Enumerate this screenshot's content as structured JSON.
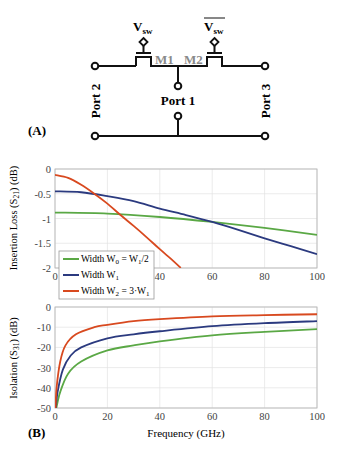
{
  "panel_a": {
    "label": "(A)",
    "ports": [
      "Port 1",
      "Port 2",
      "Port 3"
    ],
    "transistors": [
      "M1",
      "M2"
    ],
    "controls": {
      "v1": "V",
      "v1_sub": "sw",
      "v2": "V",
      "v2_sub": "sw",
      "v2_overbar": true
    }
  },
  "panel_b": {
    "label": "(B)",
    "xlabel": "Frequency (GHz)"
  },
  "colors": {
    "w0": "#5aa845",
    "w1": "#2b3a7f",
    "w2": "#d8491f",
    "grid": "#e3e3e3",
    "axis": "#b8b8b8"
  },
  "chart_data": [
    {
      "type": "line",
      "title": "",
      "xlabel": "",
      "ylabel": "Insertion Loss (S21) (dB)",
      "xlim": [
        0,
        100
      ],
      "ylim": [
        -2,
        0
      ],
      "xticks": [
        0,
        20,
        40,
        60,
        80,
        100
      ],
      "yticks": [
        0,
        -0.5,
        -1,
        -1.5,
        -2
      ],
      "ytick_labels": [
        "0",
        "-0.5",
        "-1",
        "-1.5",
        "-2"
      ],
      "grid": true,
      "legend_position": "lower left",
      "series": [
        {
          "name": "Width W0 = W1/2",
          "color": "#5aa845",
          "x": [
            0,
            20,
            40,
            60,
            80,
            100
          ],
          "y": [
            -0.88,
            -0.9,
            -0.97,
            -1.07,
            -1.19,
            -1.33
          ]
        },
        {
          "name": "Width W1",
          "color": "#2b3a7f",
          "x": [
            0,
            10,
            20,
            30,
            40,
            50,
            60,
            70,
            80,
            90,
            100
          ],
          "y": [
            -0.45,
            -0.47,
            -0.55,
            -0.65,
            -0.8,
            -0.93,
            -1.07,
            -1.23,
            -1.4,
            -1.56,
            -1.72
          ]
        },
        {
          "name": "Width W2 = 3·W1",
          "color": "#d8491f",
          "x": [
            0,
            5,
            10,
            15,
            20,
            25,
            30,
            35,
            40,
            45,
            48
          ],
          "y": [
            -0.12,
            -0.18,
            -0.32,
            -0.5,
            -0.7,
            -0.93,
            -1.15,
            -1.38,
            -1.62,
            -1.85,
            -2.0
          ]
        }
      ]
    },
    {
      "type": "line",
      "title": "",
      "xlabel": "Frequency (GHz)",
      "ylabel": "Isolation (S31) (dB)",
      "xlim": [
        0,
        100
      ],
      "ylim": [
        -50,
        0
      ],
      "xticks": [
        0,
        20,
        40,
        60,
        80,
        100
      ],
      "yticks": [
        0,
        -10,
        -20,
        -30,
        -40,
        -50
      ],
      "grid": true,
      "series": [
        {
          "name": "Width W0 = W1/2",
          "color": "#5aa845",
          "x": [
            0.5,
            2,
            5,
            10,
            20,
            30,
            40,
            60,
            80,
            100
          ],
          "y": [
            -50,
            -42,
            -33,
            -27,
            -21.5,
            -19,
            -17,
            -14,
            -12.3,
            -11
          ]
        },
        {
          "name": "Width W1",
          "color": "#2b3a7f",
          "x": [
            0.3,
            1,
            3,
            6,
            10,
            20,
            30,
            40,
            60,
            80,
            100
          ],
          "y": [
            -50,
            -42,
            -31,
            -24,
            -20,
            -15.5,
            -13.5,
            -12,
            -9.5,
            -8,
            -7
          ]
        },
        {
          "name": "Width W2 = 3·W1",
          "color": "#d8491f",
          "x": [
            0.2,
            0.6,
            2,
            4,
            8,
            15,
            20,
            30,
            40,
            60,
            80,
            100
          ],
          "y": [
            -50,
            -40,
            -27,
            -19,
            -13.5,
            -10,
            -8.8,
            -7,
            -6,
            -4.6,
            -4,
            -3.6
          ]
        }
      ]
    }
  ]
}
